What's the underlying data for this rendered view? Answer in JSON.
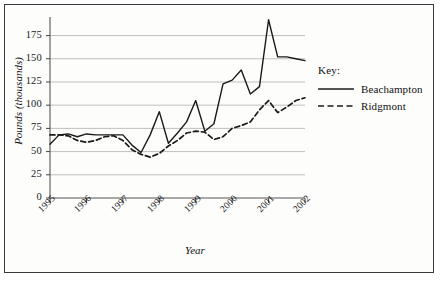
{
  "chart_data": {
    "type": "line",
    "title": "",
    "xlabel": "Year",
    "ylabel": "Pounds (thousands)",
    "ylim": [
      0,
      195
    ],
    "yticks": [
      0,
      25,
      50,
      75,
      100,
      125,
      150,
      175
    ],
    "ytick_labels": [
      "0",
      "25",
      "50",
      "75",
      "100",
      "125",
      "150",
      "175"
    ],
    "xlim": [
      1995,
      2002
    ],
    "xticks": [
      1995,
      1996,
      1997,
      1998,
      1999,
      2000,
      2001,
      2002
    ],
    "xtick_labels": [
      "1995",
      "1996",
      "1997",
      "1998",
      "1999",
      "2000",
      "2001",
      "2002"
    ],
    "grid": "horizontal",
    "legend_position": "right-outside",
    "legend_title": "Key:",
    "series": [
      {
        "name": "Beachampton",
        "style": "solid",
        "color": "#1a1a1a",
        "x": [
          1995,
          1995.25,
          1995.5,
          1995.75,
          1996,
          1996.25,
          1996.5,
          1996.75,
          1997,
          1997.25,
          1997.5,
          1997.75,
          1998,
          1998.25,
          1998.5,
          1998.75,
          1999,
          1999.25,
          1999.5,
          1999.75,
          2000,
          2000.25,
          2000.5,
          2000.75,
          2001,
          2001.25,
          2001.5,
          2001.75,
          2002
        ],
        "values": [
          58,
          68,
          69,
          66,
          69,
          68,
          68,
          68,
          68,
          57,
          49,
          68,
          93,
          59,
          70,
          82,
          105,
          72,
          80,
          123,
          127,
          138,
          112,
          120,
          192,
          152,
          152,
          150,
          148
        ]
      },
      {
        "name": "Ridgmont",
        "style": "dashed",
        "color": "#1a1a1a",
        "x": [
          1995,
          1995.25,
          1995.5,
          1995.75,
          1996,
          1996.25,
          1996.5,
          1996.75,
          1997,
          1997.25,
          1997.5,
          1997.75,
          1998,
          1998.25,
          1998.5,
          1998.75,
          1999,
          1999.25,
          1999.5,
          1999.75,
          2000,
          2000.25,
          2000.5,
          2000.75,
          2001,
          2001.25,
          2001.5,
          2001.75,
          2002
        ],
        "values": [
          68,
          68,
          67,
          62,
          60,
          62,
          66,
          67,
          62,
          52,
          47,
          44,
          48,
          56,
          62,
          70,
          72,
          71,
          63,
          66,
          75,
          78,
          82,
          95,
          105,
          92,
          98,
          105,
          108
        ]
      }
    ]
  },
  "legend": {
    "title": "Key:",
    "entries": [
      {
        "label": "Beachampton",
        "style": "solid"
      },
      {
        "label": "Ridgmont",
        "style": "dashed"
      }
    ]
  },
  "axes": {
    "y_title": "Pounds (thousands)",
    "x_title": "Year"
  }
}
